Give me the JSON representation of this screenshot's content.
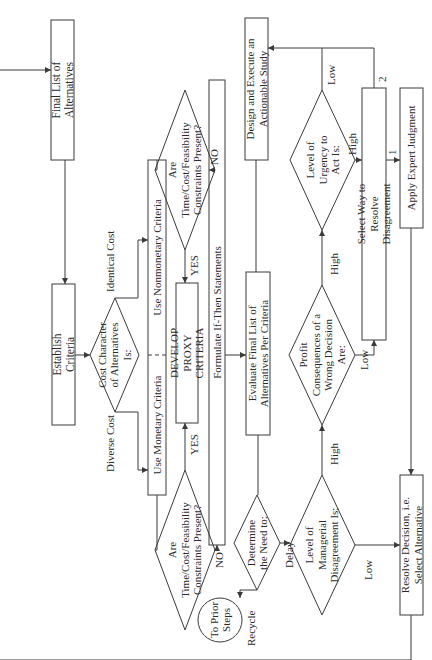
{
  "diagram": {
    "title": "",
    "orientation": "rotated 90 degrees counter-clockwise",
    "nodes": {
      "final_list": "Final List of Alternatives",
      "establish_criteria": "Establish Criteria",
      "cost_character": "Cost Character of Alternatives Is:",
      "use_monetary": "Use Monetary Criteria",
      "use_nonmonetary": "Use Nonmonetary Criteria",
      "constraints_left": "Are Time/Cost/Feasibility Constraints Present?",
      "constraints_top": "Are Time/Cost/Feasibility Constraints Present?",
      "develop_proxy": "DEVELOP PROXY CRITERIA",
      "formulate_if_then": "Formulate If-Then Statements",
      "evaluate_final_list": "Evaluate Final List of Alternatives Per Criteria",
      "design_execute": "Design and Execute an Actionable Study",
      "determine_need": "Determine the Need to:",
      "to_prior_steps": "To Prior Steps",
      "managerial_disagreement": "Level of Managerial Disagreement Is:",
      "profit_consequences": "Profit Consequences of a Wrong Decision Are:",
      "urgency": "Level of Urgency to Act Is:",
      "select_way": "Select Way to Resolve Disagreement",
      "apply_expert": "Apply Expert Judgment",
      "resolve_decision": "Resolve Decision, i.e. Select Alternative"
    },
    "edge_labels": {
      "diverse_cost": "Diverse Cost",
      "identical_cost": "Identical Cost",
      "yes_left": "YES",
      "no_left": "NO",
      "yes_top": "YES",
      "no_top": "NO",
      "recycle": "Recycle",
      "delay": "Delay",
      "high_mgr": "High",
      "low_mgr": "Low",
      "high_profit": "High",
      "low_profit": "Low",
      "high_urgency": "High",
      "low_urgency": "Low",
      "option_1": "1",
      "option_2": "2"
    },
    "colors": {
      "line": "#3a3a3a",
      "text": "#2a2a2a",
      "background": "#ffffff"
    }
  }
}
